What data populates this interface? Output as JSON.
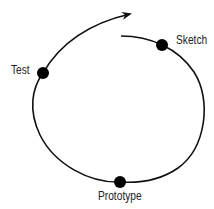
{
  "diagram": {
    "type": "cycle",
    "direction": "clockwise-spiral",
    "stages": [
      {
        "label": "Sketch"
      },
      {
        "label": "Prototype"
      },
      {
        "label": "Test"
      }
    ],
    "colors": {
      "line": "#111111",
      "dot": "#000000",
      "text": "#222222"
    }
  }
}
